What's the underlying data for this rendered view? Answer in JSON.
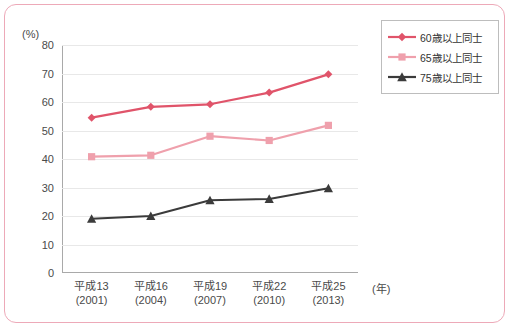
{
  "chart_data": {
    "type": "line",
    "title": "",
    "subtitle": "",
    "xlabel": "(年)",
    "ylabel": "(%)",
    "ylim": [
      0,
      80
    ],
    "ytick_step": 10,
    "yticks": [
      "80",
      "70",
      "60",
      "50",
      "40",
      "30",
      "20",
      "10",
      "0"
    ],
    "grid": true,
    "legend_position": "top-right",
    "categories": [
      "平成13\n(2001)",
      "平成16\n(2004)",
      "平成19\n(2007)",
      "平成22\n(2010)",
      "平成25\n(2013)"
    ],
    "x_ticks": [
      {
        "era": "平成13",
        "west": "(2001)"
      },
      {
        "era": "平成16",
        "west": "(2004)"
      },
      {
        "era": "平成19",
        "west": "(2007)"
      },
      {
        "era": "平成22",
        "west": "(2010)"
      },
      {
        "era": "平成25",
        "west": "(2013)"
      }
    ],
    "series": [
      {
        "name": "60歳以上同士",
        "color": "#e0546a",
        "marker": "diamond",
        "values": [
          54.5,
          58.3,
          59.2,
          63.3,
          69.7
        ]
      },
      {
        "name": "65歳以上同士",
        "color": "#efa0ac",
        "marker": "square",
        "values": [
          40.8,
          41.3,
          48.0,
          46.5,
          51.8
        ]
      },
      {
        "name": "75歳以上同士",
        "color": "#3b3b3b",
        "marker": "triangle",
        "values": [
          19.0,
          20.0,
          25.5,
          26.0,
          29.7
        ]
      }
    ]
  },
  "frame": {
    "border_color": "#eda9b8"
  },
  "axis": {
    "unit_y": "(%)",
    "unit_x": "(年)"
  },
  "legend": {
    "items": [
      {
        "label": "60歳以上同士",
        "color": "#e0546a",
        "marker": "diamond"
      },
      {
        "label": "65歳以上同士",
        "color": "#efa0ac",
        "marker": "square"
      },
      {
        "label": "75歳以上同士",
        "color": "#3b3b3b",
        "marker": "triangle"
      }
    ]
  }
}
